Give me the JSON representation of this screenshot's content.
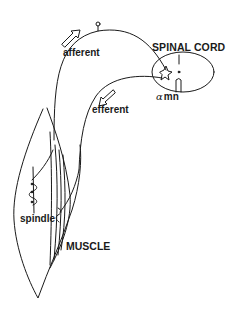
{
  "diagram": {
    "labels": {
      "spinal_cord": "SPINAL CORD",
      "alpha_symbol": "α",
      "motor_neuron": "mn",
      "afferent": "afferent",
      "efferent": "efferent",
      "spindle": "spindle",
      "muscle": "MUSCLE"
    },
    "components": [
      {
        "id": "spinal-cord",
        "shape": "ellipse"
      },
      {
        "id": "alpha-motor-neuron",
        "shape": "star-cell"
      },
      {
        "id": "afferent-nerve",
        "shape": "curve",
        "direction": "toward spinal cord"
      },
      {
        "id": "dorsal-root-ganglion",
        "shape": "small-circle"
      },
      {
        "id": "efferent-nerve",
        "shape": "curve",
        "direction": "toward muscle"
      },
      {
        "id": "muscle",
        "shape": "spindle-outline"
      },
      {
        "id": "muscle-spindle",
        "shape": "coiled-receptor"
      }
    ],
    "colors": {
      "stroke": "#1a1a1a",
      "background": "#ffffff"
    }
  }
}
